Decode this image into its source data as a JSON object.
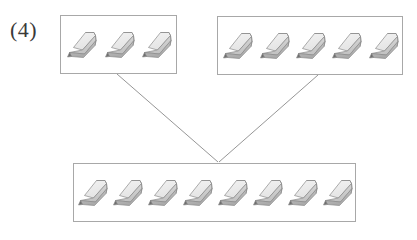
{
  "figure": {
    "label": "(4)",
    "object_icon": "pencil-icon",
    "object_name": "pencil",
    "colors": {
      "outline": "#8a8a8a",
      "box_border": "#a8a8a8",
      "body_light": "#e4e4e4",
      "body_mid": "#c9c9c9",
      "body_dark": "#a9a9a9",
      "tip_dark": "#6e6e6e",
      "background": "#ffffff",
      "label_text": "#3a3a3a"
    },
    "groups": [
      {
        "id": "top-left",
        "name": "part-group-1",
        "count": 3
      },
      {
        "id": "top-right",
        "name": "part-group-2",
        "count": 5
      },
      {
        "id": "bottom",
        "name": "whole-group",
        "count": 8
      }
    ],
    "connectors": [
      {
        "name": "connector-left",
        "from": "top-left-box",
        "to": "whole-box"
      },
      {
        "name": "connector-right",
        "from": "top-right-box",
        "to": "whole-box"
      }
    ]
  }
}
